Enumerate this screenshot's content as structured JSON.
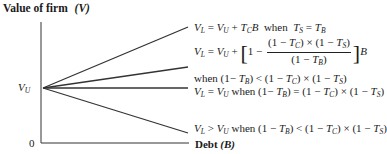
{
  "title": {
    "text": "Value of firm",
    "variable": "(V)"
  },
  "axes": {
    "y_label": "Value of firm (V)",
    "x_label_text": "Debt",
    "x_label_var": "(B)",
    "origin_label": "0",
    "vu_label": "V",
    "vu_sub": "U"
  },
  "lines": [
    {
      "id": "line-1",
      "equation": "V_L = V_U + T_C·B when T_S = T_B",
      "slope": "positive-steep",
      "end_y": 27
    },
    {
      "id": "line-2",
      "equation": "V_L = V_U + [1 − (1−T_C)×(1−T_S)/(1−T_B)]B when (1−T_B) < (1−T_C)×(1−T_S)",
      "slope": "positive-shallow",
      "end_y": 67
    },
    {
      "id": "line-3",
      "equation": "V_L = V_U when (1−T_B) = (1−T_C)×(1−T_S)",
      "slope": "zero",
      "end_y": 88
    },
    {
      "id": "line-4",
      "equation": "V_L > V_U when (1−T_B) < (1−T_C)×(1−T_S)",
      "slope": "negative",
      "end_y": 133
    }
  ],
  "labels": {
    "l1": {
      "when": "when",
      "eq": "="
    },
    "l2_when": "when",
    "l3_when": "when",
    "l4_when": "when"
  }
}
